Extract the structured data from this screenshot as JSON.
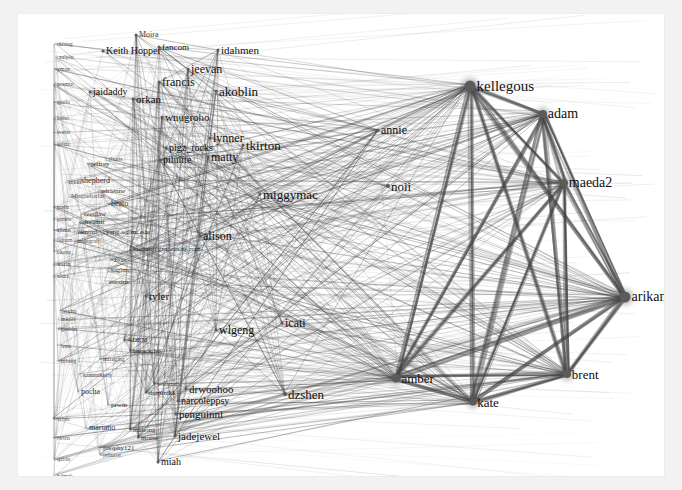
{
  "visualization": {
    "type": "force-directed-network-graph",
    "title": "",
    "canvas_background": "#ffffff",
    "page_background": "#f2f2f2",
    "edge_color": "#444444",
    "node_color": "#5b5b5b",
    "label_color": "#101010"
  },
  "chart_data": {
    "type": "scatter",
    "title": "",
    "xlabel": "",
    "ylabel": "",
    "grid": false,
    "legend": "none",
    "nodes": [
      {
        "label": "kellegous",
        "x": 452,
        "y": 72,
        "size": 11,
        "font": 15
      },
      {
        "label": "adam",
        "x": 525,
        "y": 100,
        "size": 8,
        "font": 14
      },
      {
        "label": "maeda2",
        "x": 546,
        "y": 169,
        "size": 8,
        "font": 14
      },
      {
        "label": "arikan",
        "x": 607,
        "y": 283,
        "size": 11,
        "font": 14
      },
      {
        "label": "brent",
        "x": 549,
        "y": 360,
        "size": 8,
        "font": 13
      },
      {
        "label": "kate",
        "x": 455,
        "y": 388,
        "size": 7,
        "font": 13
      },
      {
        "label": "amber",
        "x": 378,
        "y": 364,
        "size": 9,
        "font": 13
      },
      {
        "label": "dzshen",
        "x": 267,
        "y": 380,
        "size": 4,
        "font": 13
      },
      {
        "label": "noii",
        "x": 370,
        "y": 172,
        "size": 4,
        "font": 13
      },
      {
        "label": "annie",
        "x": 360,
        "y": 116,
        "size": 3,
        "font": 12
      },
      {
        "label": "miggymac",
        "x": 242,
        "y": 180,
        "size": 3,
        "font": 13
      },
      {
        "label": "tkirton",
        "x": 225,
        "y": 131,
        "size": 3,
        "font": 13
      },
      {
        "label": "lynner",
        "x": 192,
        "y": 124,
        "size": 3,
        "font": 12
      },
      {
        "label": "matty",
        "x": 190,
        "y": 143,
        "size": 3,
        "font": 12
      },
      {
        "label": "akoblin",
        "x": 198,
        "y": 77,
        "size": 3,
        "font": 13
      },
      {
        "label": "jeevan",
        "x": 170,
        "y": 55,
        "size": 3,
        "font": 12
      },
      {
        "label": "idahmen",
        "x": 200,
        "y": 36,
        "size": 3,
        "font": 11
      },
      {
        "label": "francis",
        "x": 141,
        "y": 68,
        "size": 3,
        "font": 12
      },
      {
        "label": "orkan",
        "x": 115,
        "y": 85,
        "size": 3,
        "font": 11
      },
      {
        "label": "jaidaddy",
        "x": 72,
        "y": 78,
        "size": 3,
        "font": 10
      },
      {
        "label": "Keith Hopper",
        "x": 85,
        "y": 37,
        "size": 3,
        "font": 10
      },
      {
        "label": "fancom",
        "x": 141,
        "y": 33,
        "size": 3,
        "font": 9
      },
      {
        "label": "Moira",
        "x": 118,
        "y": 21,
        "size": 3,
        "font": 8
      },
      {
        "label": "wnugroho",
        "x": 144,
        "y": 103,
        "size": 3,
        "font": 11
      },
      {
        "label": "pigz_rocks",
        "x": 148,
        "y": 134,
        "size": 3,
        "font": 10
      },
      {
        "label": "pilulite",
        "x": 142,
        "y": 146,
        "size": 3,
        "font": 10
      },
      {
        "label": "alison",
        "x": 182,
        "y": 222,
        "size": 3,
        "font": 12
      },
      {
        "label": "icati",
        "x": 264,
        "y": 309,
        "size": 3,
        "font": 12
      },
      {
        "label": "wlgeng",
        "x": 198,
        "y": 316,
        "size": 3,
        "font": 12
      },
      {
        "label": "tyler",
        "x": 128,
        "y": 282,
        "size": 3,
        "font": 11
      },
      {
        "label": "drwoohoo",
        "x": 168,
        "y": 375,
        "size": 3,
        "font": 11
      },
      {
        "label": "narcoleppsy",
        "x": 160,
        "y": 387,
        "size": 3,
        "font": 10
      },
      {
        "label": "penguinni",
        "x": 158,
        "y": 400,
        "size": 3,
        "font": 11
      },
      {
        "label": "jadejewel",
        "x": 157,
        "y": 422,
        "size": 3,
        "font": 11
      },
      {
        "label": "miah",
        "x": 140,
        "y": 448,
        "size": 3,
        "font": 10
      },
      {
        "label": "mahong",
        "x": 112,
        "y": 416,
        "size": 2,
        "font": 7
      },
      {
        "label": "shepherd",
        "x": 60,
        "y": 167,
        "size": 2,
        "font": 8
      },
      {
        "label": "adrienne",
        "x": 80,
        "y": 177,
        "size": 2,
        "font": 7
      },
      {
        "label": "beato",
        "x": 90,
        "y": 190,
        "size": 2,
        "font": 8
      },
      {
        "label": "reedlaw",
        "x": 63,
        "y": 200,
        "size": 2,
        "font": 7
      },
      {
        "label": "dreamit",
        "x": 62,
        "y": 208,
        "size": 2,
        "font": 7
      },
      {
        "label": "aknouf",
        "x": 57,
        "y": 218,
        "size": 2,
        "font": 7
      },
      {
        "label": "yang.s@mr.edu",
        "x": 85,
        "y": 218,
        "size": 2,
        "font": 7
      },
      {
        "label": "mdegraft",
        "x": 57,
        "y": 227,
        "size": 2,
        "font": 6
      },
      {
        "label": "kuclan@graceus.nj.com",
        "x": 112,
        "y": 235,
        "size": 2,
        "font": 7
      },
      {
        "label": "zeas",
        "x": 93,
        "y": 246,
        "size": 2,
        "font": 7
      },
      {
        "label": "saglmc",
        "x": 90,
        "y": 256,
        "size": 2,
        "font": 7
      },
      {
        "label": "esesins",
        "x": 88,
        "y": 268,
        "size": 2,
        "font": 7
      },
      {
        "label": "jeffrey",
        "x": 70,
        "y": 150,
        "size": 2,
        "font": 7
      },
      {
        "label": "rbutts",
        "x": 88,
        "y": 145,
        "size": 2,
        "font": 6
      },
      {
        "label": "Mlaguefiarlas",
        "x": 50,
        "y": 182,
        "size": 2,
        "font": 6
      },
      {
        "label": "nikki",
        "x": 48,
        "y": 168,
        "size": 2,
        "font": 6
      },
      {
        "label": "ADEM",
        "x": 106,
        "y": 326,
        "size": 2,
        "font": 7
      },
      {
        "label": "barack.ltd",
        "x": 112,
        "y": 337,
        "size": 2,
        "font": 7
      },
      {
        "label": "mfreging",
        "x": 82,
        "y": 345,
        "size": 2,
        "font": 6
      },
      {
        "label": "pocha",
        "x": 60,
        "y": 378,
        "size": 2,
        "font": 8
      },
      {
        "label": "prwin",
        "x": 90,
        "y": 391,
        "size": 2,
        "font": 7
      },
      {
        "label": "dominikk",
        "x": 128,
        "y": 379,
        "size": 2,
        "font": 7
      },
      {
        "label": "wolfcrat",
        "x": 136,
        "y": 370,
        "size": 2,
        "font": 6
      },
      {
        "label": "kaminikerly",
        "x": 62,
        "y": 361,
        "size": 2,
        "font": 6
      },
      {
        "label": "mariano",
        "x": 68,
        "y": 414,
        "size": 2,
        "font": 8
      },
      {
        "label": "morse",
        "x": 120,
        "y": 424,
        "size": 2,
        "font": 7
      },
      {
        "label": "jiaophy121",
        "x": 82,
        "y": 434,
        "size": 2,
        "font": 7
      },
      {
        "label": "jellucot",
        "x": 82,
        "y": 441,
        "size": 2,
        "font": 6
      },
      {
        "label": "yrcha",
        "x": 42,
        "y": 297,
        "size": 2,
        "font": 6
      },
      {
        "label": "mkilli",
        "x": 40,
        "y": 305,
        "size": 2,
        "font": 6
      },
      {
        "label": "gorbin",
        "x": 40,
        "y": 315,
        "size": 2,
        "font": 6
      },
      {
        "label": "lenn",
        "x": 40,
        "y": 332,
        "size": 2,
        "font": 6
      },
      {
        "label": "hiberg",
        "x": 40,
        "y": 347,
        "size": 2,
        "font": 6
      },
      {
        "label": "sulpin",
        "x": 38,
        "y": 43,
        "size": 2,
        "font": 6
      },
      {
        "label": "rkbing",
        "x": 36,
        "y": 30,
        "size": 2,
        "font": 6
      },
      {
        "label": "ymaz",
        "x": 36,
        "y": 55,
        "size": 2,
        "font": 6
      },
      {
        "label": "prsmin",
        "x": 36,
        "y": 70,
        "size": 2,
        "font": 6
      },
      {
        "label": "geelo",
        "x": 36,
        "y": 88,
        "size": 2,
        "font": 6
      },
      {
        "label": "kelnt",
        "x": 36,
        "y": 104,
        "size": 2,
        "font": 6
      },
      {
        "label": "borln",
        "x": 36,
        "y": 118,
        "size": 2,
        "font": 6
      },
      {
        "label": "selda",
        "x": 36,
        "y": 130,
        "size": 2,
        "font": 6
      },
      {
        "label": "gieln",
        "x": 36,
        "y": 193,
        "size": 2,
        "font": 6
      },
      {
        "label": "pinkw",
        "x": 36,
        "y": 205,
        "size": 2,
        "font": 6
      },
      {
        "label": "zlimn",
        "x": 36,
        "y": 216,
        "size": 2,
        "font": 6
      },
      {
        "label": "odnrm",
        "x": 36,
        "y": 226,
        "size": 2,
        "font": 6
      },
      {
        "label": "bkenz",
        "x": 36,
        "y": 238,
        "size": 2,
        "font": 6
      },
      {
        "label": "wsrln",
        "x": 36,
        "y": 250,
        "size": 2,
        "font": 6
      },
      {
        "label": "nldrs",
        "x": 36,
        "y": 262,
        "size": 2,
        "font": 6
      },
      {
        "label": "vrbnt",
        "x": 36,
        "y": 405,
        "size": 2,
        "font": 6
      },
      {
        "label": "lwtrn",
        "x": 36,
        "y": 424,
        "size": 2,
        "font": 6
      },
      {
        "label": "qzbln",
        "x": 36,
        "y": 445,
        "size": 2,
        "font": 6
      },
      {
        "label": "hdmrk",
        "x": 36,
        "y": 462,
        "size": 2,
        "font": 6
      }
    ],
    "hubs": [
      "kellegous",
      "adam",
      "maeda2",
      "arikan",
      "brent",
      "kate",
      "amber"
    ],
    "edge_count_estimate": 1200,
    "node_count_estimate": 88
  }
}
